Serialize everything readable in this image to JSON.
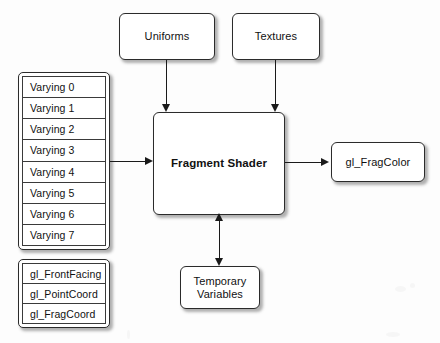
{
  "diagram": {
    "type": "block-diagram",
    "stroke_color": "#2b2b2b",
    "background_color": "#fdfdfd",
    "inputs_top": [
      {
        "label": "Uniforms"
      },
      {
        "label": "Textures"
      }
    ],
    "varyings": {
      "rows": [
        {
          "label": "Varying 0"
        },
        {
          "label": "Varying 1"
        },
        {
          "label": "Varying 2"
        },
        {
          "label": "Varying 3"
        },
        {
          "label": "Varying 4"
        },
        {
          "label": "Varying 5"
        },
        {
          "label": "Varying 6"
        },
        {
          "label": "Varying 7"
        }
      ]
    },
    "builtins": {
      "rows": [
        {
          "label": "gl_FrontFacing"
        },
        {
          "label": "gl_PointCoord"
        },
        {
          "label": "gl_FragCoord"
        }
      ]
    },
    "processor": {
      "label": "Fragment Shader"
    },
    "output": {
      "label": "gl_FragColor"
    },
    "scratch": {
      "label_line1": "Temporary",
      "label_line2": "Variables"
    },
    "connections": [
      {
        "from": "Uniforms",
        "to": "Fragment Shader",
        "direction": "down"
      },
      {
        "from": "Textures",
        "to": "Fragment Shader",
        "direction": "down"
      },
      {
        "from": "Varyings",
        "to": "Fragment Shader",
        "direction": "right"
      },
      {
        "from": "Fragment Shader",
        "to": "gl_FragColor",
        "direction": "right"
      },
      {
        "from": "Fragment Shader",
        "to": "Temporary Variables",
        "direction": "bidirectional"
      }
    ]
  }
}
